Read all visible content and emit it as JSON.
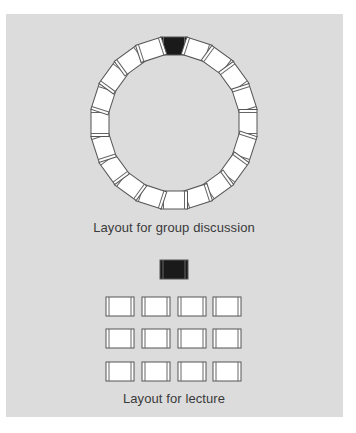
{
  "colors": {
    "background": "#ffffff",
    "panel": "#dcdcdc",
    "chair_fill": "#ffffff",
    "chair_outline": "#555555",
    "leader_chair_fill": "#1a1a1a",
    "caption_text": "#3a3a3a"
  },
  "group_discussion": {
    "caption": "Layout for group discussion",
    "chair_count": 20,
    "leader_chair_index": 0,
    "ring": {
      "cx": 174,
      "cy": 123,
      "rx": 74,
      "ry": 77
    }
  },
  "lecture": {
    "caption": "Layout for lecture",
    "lecturer_chair": {
      "x": 160,
      "y": 260,
      "w": 28,
      "h": 19
    },
    "rows": 3,
    "columns": 4,
    "grid": {
      "x_positions": [
        106,
        142,
        178,
        213
      ],
      "y_positions": [
        297,
        329,
        362
      ],
      "w": 28,
      "h": 19
    }
  }
}
